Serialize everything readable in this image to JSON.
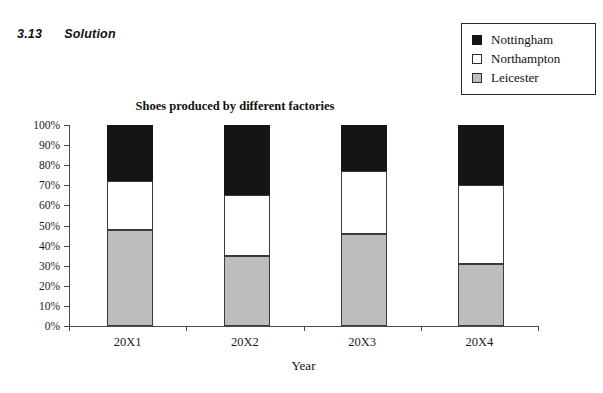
{
  "page": {
    "top_partial_text": "—  —   — —   ——   —   —  ——   — ——",
    "section_number": "3.13",
    "section_title": "Solution"
  },
  "colors": {
    "nottingham": "#151515",
    "northampton": "#ffffff",
    "leicester": "#bdbdbd",
    "axis": "#4a4a4a",
    "bar_outline": "#3a3a3a",
    "legend_border": "#2b2b2b",
    "background": "#ffffff"
  },
  "legend": {
    "position": "top-right",
    "items": [
      {
        "label": "Nottingham",
        "swatch": "#151515"
      },
      {
        "label": "Northampton",
        "swatch": "#ffffff"
      },
      {
        "label": "Leicester",
        "swatch": "#bdbdbd"
      }
    ]
  },
  "chart_data": {
    "type": "bar",
    "stacked": true,
    "stack_mode": "percent",
    "title": "Shoes produced by different factories",
    "xlabel": "Year",
    "ylabel": "",
    "categories": [
      "20X1",
      "20X2",
      "20X3",
      "20X4"
    ],
    "ylim": [
      0,
      100
    ],
    "yticks": [
      0,
      10,
      20,
      30,
      40,
      50,
      60,
      70,
      80,
      90,
      100
    ],
    "ytick_labels": [
      "0%",
      "10%",
      "20%",
      "30%",
      "40%",
      "50%",
      "60%",
      "70%",
      "80%",
      "90%",
      "100%"
    ],
    "grid": false,
    "legend_position": "outside top-right",
    "series": [
      {
        "name": "Leicester",
        "color": "#bdbdbd",
        "values": [
          48,
          35,
          46,
          31
        ]
      },
      {
        "name": "Northampton",
        "color": "#ffffff",
        "values": [
          24,
          30,
          31,
          39
        ]
      },
      {
        "name": "Nottingham",
        "color": "#151515",
        "values": [
          28,
          35,
          23,
          30
        ]
      }
    ],
    "cumulative_tops": {
      "Leicester": [
        48,
        35,
        46,
        31
      ],
      "Northampton": [
        72,
        65,
        77,
        70
      ],
      "Nottingham": [
        100,
        100,
        100,
        100
      ]
    }
  }
}
